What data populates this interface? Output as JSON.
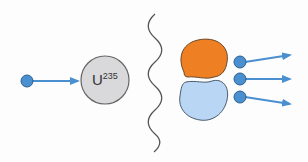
{
  "diagram": {
    "title": "",
    "before": {
      "incoming_neutron": {
        "label": "",
        "color": "#4a8fd0"
      },
      "nucleus": {
        "symbol": "U",
        "mass_number": "235",
        "color": "#d9d9dc"
      }
    },
    "separator": {
      "type": "wavy-line",
      "color": "#555555"
    },
    "after": {
      "fragments": [
        {
          "name": "fragment-1",
          "color": "#ee7f22"
        },
        {
          "name": "fragment-2",
          "color": "#b9d6f4"
        }
      ],
      "emitted_neutrons": 3,
      "neutron_color": "#4a8fd0",
      "arrow_color": "#4a8fd0"
    }
  }
}
